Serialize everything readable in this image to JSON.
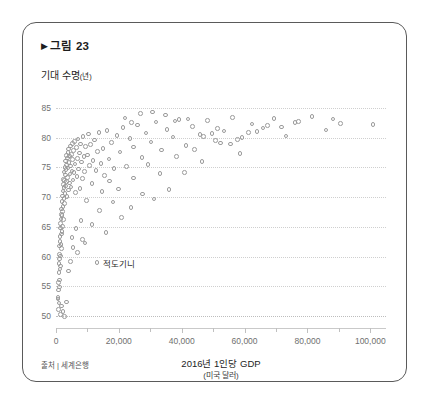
{
  "card": {
    "figure_label": "그림 23",
    "triangle_glyph": "▶",
    "source_note": "출처 | 세계은행"
  },
  "chart_data": {
    "type": "scatter",
    "title": "그림 23",
    "xlabel": "2016년 1인당 GDP",
    "xlabel_sub": "(미국 달러)",
    "ylabel": "기대 수명",
    "ylabel_unit": "(년)",
    "xlim": [
      0,
      105000
    ],
    "ylim": [
      48,
      87
    ],
    "grid": true,
    "legend": "none",
    "marker": {
      "shape": "circle-open",
      "color": "#9b9b9b",
      "size": 4.6
    },
    "xticks": [
      0,
      20000,
      40000,
      60000,
      80000,
      100000
    ],
    "xtick_labels": [
      "0",
      "20,000",
      "40,000",
      "60,000",
      "80,000",
      "100,000"
    ],
    "xticks_minor": [
      10000,
      30000,
      50000,
      70000,
      90000
    ],
    "yticks": [
      50,
      55,
      60,
      65,
      70,
      75,
      80,
      85
    ],
    "ytick_labels": [
      "50",
      "55",
      "60",
      "65",
      "70",
      "75",
      "80",
      "85"
    ],
    "annotations": [
      {
        "label": "적도기니",
        "x": 13000,
        "y": 59.0
      }
    ],
    "points": [
      [
        620,
        52.9
      ],
      [
        700,
        53.1
      ],
      [
        780,
        54.4
      ],
      [
        820,
        51.1
      ],
      [
        860,
        55.6
      ],
      [
        900,
        57.3
      ],
      [
        940,
        52.2
      ],
      [
        980,
        58.8
      ],
      [
        1020,
        56.1
      ],
      [
        1060,
        60.4
      ],
      [
        1100,
        54.9
      ],
      [
        1150,
        59.6
      ],
      [
        1190,
        61.8
      ],
      [
        1240,
        57.9
      ],
      [
        1280,
        62.5
      ],
      [
        1320,
        63.4
      ],
      [
        1380,
        60.1
      ],
      [
        1420,
        64.8
      ],
      [
        1460,
        58.4
      ],
      [
        1510,
        65.6
      ],
      [
        1560,
        62.0
      ],
      [
        1600,
        66.3
      ],
      [
        1660,
        63.8
      ],
      [
        1700,
        67.1
      ],
      [
        1750,
        61.4
      ],
      [
        1800,
        68.0
      ],
      [
        1850,
        64.2
      ],
      [
        1900,
        66.9
      ],
      [
        1960,
        69.3
      ],
      [
        2010,
        65.1
      ],
      [
        2070,
        70.2
      ],
      [
        2120,
        67.6
      ],
      [
        2180,
        71.0
      ],
      [
        2240,
        68.4
      ],
      [
        2300,
        72.1
      ],
      [
        2360,
        66.2
      ],
      [
        2420,
        73.0
      ],
      [
        2490,
        69.8
      ],
      [
        2550,
        71.6
      ],
      [
        2610,
        74.2
      ],
      [
        2680,
        68.9
      ],
      [
        2740,
        72.8
      ],
      [
        2810,
        75.0
      ],
      [
        2880,
        70.6
      ],
      [
        2950,
        73.7
      ],
      [
        3020,
        76.1
      ],
      [
        3100,
        71.9
      ],
      [
        3180,
        74.6
      ],
      [
        3250,
        77.0
      ],
      [
        3330,
        72.6
      ],
      [
        3410,
        75.4
      ],
      [
        3500,
        70.1
      ],
      [
        3580,
        76.6
      ],
      [
        3670,
        73.3
      ],
      [
        3760,
        77.5
      ],
      [
        3850,
        74.9
      ],
      [
        3940,
        71.2
      ],
      [
        4040,
        78.1
      ],
      [
        4140,
        75.8
      ],
      [
        4240,
        72.4
      ],
      [
        4350,
        76.9
      ],
      [
        4460,
        73.9
      ],
      [
        4570,
        78.6
      ],
      [
        4690,
        75.2
      ],
      [
        4810,
        71.7
      ],
      [
        4930,
        77.2
      ],
      [
        5060,
        74.4
      ],
      [
        5190,
        79.0
      ],
      [
        5330,
        76.3
      ],
      [
        5470,
        72.9
      ],
      [
        5620,
        77.8
      ],
      [
        5770,
        74.1
      ],
      [
        5930,
        79.4
      ],
      [
        6090,
        75.6
      ],
      [
        6260,
        70.8
      ],
      [
        6440,
        78.3
      ],
      [
        6620,
        73.5
      ],
      [
        6810,
        76.5
      ],
      [
        7010,
        79.8
      ],
      [
        7210,
        74.7
      ],
      [
        7420,
        77.4
      ],
      [
        7640,
        71.5
      ],
      [
        7870,
        78.9
      ],
      [
        8100,
        75.9
      ],
      [
        8350,
        73.1
      ],
      [
        8600,
        80.2
      ],
      [
        8860,
        76.8
      ],
      [
        9130,
        74.3
      ],
      [
        9410,
        78.5
      ],
      [
        9700,
        69.4
      ],
      [
        10000,
        77.1
      ],
      [
        10300,
        80.6
      ],
      [
        10650,
        75.3
      ],
      [
        11000,
        78.8
      ],
      [
        11400,
        72.3
      ],
      [
        11800,
        76.2
      ],
      [
        12200,
        79.6
      ],
      [
        12700,
        74.5
      ],
      [
        13200,
        77.7
      ],
      [
        13700,
        80.9
      ],
      [
        14300,
        75.7
      ],
      [
        14900,
        78.2
      ],
      [
        15500,
        73.6
      ],
      [
        16200,
        81.2
      ],
      [
        16900,
        76.4
      ],
      [
        17700,
        79.2
      ],
      [
        18500,
        74.8
      ],
      [
        19400,
        80.4
      ],
      [
        20300,
        77.6
      ],
      [
        21300,
        81.7
      ],
      [
        22400,
        75.1
      ],
      [
        23500,
        79.9
      ],
      [
        24700,
        78.4
      ],
      [
        26000,
        82.1
      ],
      [
        27300,
        76.7
      ],
      [
        28700,
        80.8
      ],
      [
        30200,
        79.3
      ],
      [
        31800,
        82.6
      ],
      [
        33500,
        77.9
      ],
      [
        35300,
        81.4
      ],
      [
        37200,
        80.1
      ],
      [
        39200,
        83.0
      ],
      [
        41300,
        78.7
      ],
      [
        43500,
        81.9
      ],
      [
        45800,
        80.5
      ],
      [
        48200,
        82.9
      ],
      [
        50700,
        79.5
      ],
      [
        53400,
        81.1
      ],
      [
        56200,
        83.4
      ],
      [
        59200,
        80.0
      ],
      [
        62400,
        82.3
      ],
      [
        65800,
        81.6
      ],
      [
        69400,
        83.2
      ],
      [
        73200,
        80.3
      ],
      [
        77200,
        82.7
      ],
      [
        81400,
        83.6
      ],
      [
        85900,
        81.3
      ],
      [
        90600,
        82.4
      ],
      [
        100800,
        82.2
      ],
      [
        2200,
        50.8
      ],
      [
        2650,
        49.9
      ],
      [
        3300,
        52.4
      ],
      [
        1450,
        50.3
      ],
      [
        1820,
        51.7
      ],
      [
        5100,
        63.2
      ],
      [
        6300,
        64.7
      ],
      [
        7900,
        66.1
      ],
      [
        9200,
        62.3
      ],
      [
        11500,
        65.4
      ],
      [
        13800,
        67.8
      ],
      [
        15900,
        64.1
      ],
      [
        18200,
        69.2
      ],
      [
        20800,
        66.6
      ],
      [
        23900,
        68.3
      ],
      [
        27600,
        70.5
      ],
      [
        31200,
        69.7
      ],
      [
        35900,
        71.3
      ],
      [
        40800,
        74.1
      ],
      [
        46500,
        76.0
      ],
      [
        52300,
        79.1
      ],
      [
        58600,
        77.3
      ],
      [
        14600,
        70.9
      ],
      [
        17100,
        72.7
      ],
      [
        19800,
        71.4
      ],
      [
        24600,
        73.2
      ],
      [
        29300,
        75.5
      ],
      [
        33100,
        74.0
      ],
      [
        38400,
        76.8
      ],
      [
        44100,
        78.0
      ],
      [
        49700,
        80.7
      ],
      [
        55500,
        78.9
      ],
      [
        61200,
        80.9
      ],
      [
        67300,
        82.0
      ],
      [
        71800,
        81.8
      ],
      [
        4600,
        59.2
      ],
      [
        3900,
        57.6
      ],
      [
        5400,
        61.5
      ],
      [
        6900,
        60.7
      ],
      [
        8400,
        62.9
      ],
      [
        26800,
        84.1
      ],
      [
        30700,
        84.3
      ],
      [
        34800,
        83.8
      ],
      [
        42000,
        83.1
      ],
      [
        37900,
        82.8
      ],
      [
        21900,
        83.3
      ],
      [
        24100,
        82.5
      ],
      [
        46900,
        80.2
      ],
      [
        51400,
        81.5
      ],
      [
        57800,
        79.7
      ],
      [
        63900,
        81.0
      ],
      [
        76100,
        82.5
      ],
      [
        88200,
        83.1
      ]
    ]
  }
}
